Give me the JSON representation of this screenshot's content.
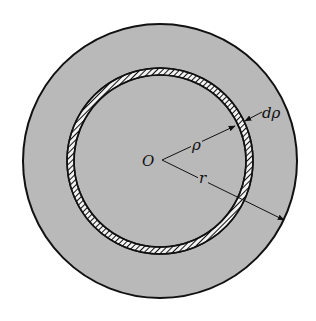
{
  "figure": {
    "labels": {
      "center": "O",
      "ring_radius": "ρ",
      "outer_radius": "r",
      "ring_thickness": "dρ"
    },
    "colors": {
      "fill": "#b9b9b9",
      "stroke": "#111111",
      "background": "#ffffff"
    }
  }
}
